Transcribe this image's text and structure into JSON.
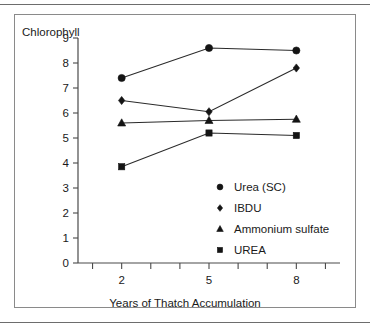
{
  "chart_data": {
    "type": "line",
    "title": "",
    "xlabel": "Years of Thatch Accumulation",
    "ylabel": "Chlorophyll",
    "x": [
      2,
      5,
      8
    ],
    "xlim": [
      0.5,
      9.5
    ],
    "ylim": [
      0,
      9
    ],
    "xticks": [
      2,
      5,
      8
    ],
    "xtick_labels": [
      "2",
      "5",
      "8"
    ],
    "yticks": [
      0,
      1,
      2,
      3,
      4,
      5,
      6,
      7,
      8,
      9
    ],
    "ytick_labels": [
      "0",
      "1",
      "2",
      "3",
      "4",
      "5",
      "6",
      "7",
      "8",
      "9"
    ],
    "grid": false,
    "legend_position": "inside-lower-right",
    "series": [
      {
        "name": "Urea (SC)",
        "marker": "circle",
        "values": [
          7.4,
          8.6,
          8.5
        ]
      },
      {
        "name": "IBDU",
        "marker": "diamond",
        "values": [
          6.5,
          6.05,
          7.8
        ]
      },
      {
        "name": "Ammonium sulfate",
        "marker": "triangle",
        "values": [
          5.6,
          5.7,
          5.75
        ]
      },
      {
        "name": "UREA",
        "marker": "square",
        "values": [
          3.85,
          5.2,
          5.1
        ]
      }
    ]
  },
  "axes": {
    "y_title": "Chlorophyll",
    "x_title": "Years of Thatch Accumulation",
    "y_labels": [
      "9",
      "8",
      "7",
      "6",
      "5",
      "4",
      "3",
      "2",
      "1",
      "0"
    ],
    "x_labels": [
      "2",
      "5",
      "8"
    ]
  },
  "legend": {
    "items": [
      {
        "label": "Urea (SC)",
        "marker": "circle"
      },
      {
        "label": "IBDU",
        "marker": "diamond"
      },
      {
        "label": "Ammonium sulfate",
        "marker": "triangle"
      },
      {
        "label": "UREA",
        "marker": "square"
      }
    ]
  },
  "colors": {
    "ink": "#141414",
    "axis": "#4a4a4a",
    "frame": "#8a8a8a",
    "rule": "#6d6d6d",
    "background": "#ffffff"
  }
}
